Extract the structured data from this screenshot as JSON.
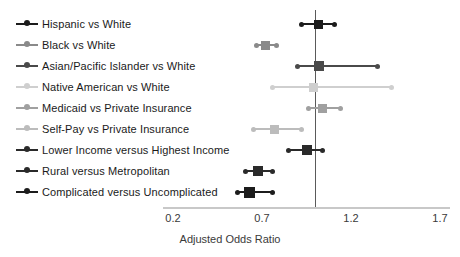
{
  "chart_data": {
    "type": "scatter",
    "subtype": "forest-plot",
    "title": "",
    "xlabel": "Adjusted Odds Ratio",
    "ylabel": "",
    "xlim": [
      0.2,
      1.7
    ],
    "xticks": [
      0.2,
      0.7,
      1.2,
      1.7
    ],
    "xtick_labels": [
      "0.2",
      "0.7",
      "1.2",
      "1.7"
    ],
    "reference_line": 1.0,
    "grid": false,
    "legend_position": "left-inline",
    "categories": [
      "Hispanic vs White",
      "Black vs White",
      "Asian/Pacific Islander vs White",
      "Native American vs White",
      "Medicaid vs Private Insurance",
      "Self-Pay vs Private Insurance",
      "Lower Income versus Highest Income",
      "Rural versus Metropolitan",
      "Complicated versus Uncomplicated"
    ],
    "rows": [
      {
        "label": "Hispanic vs White",
        "or": 1.02,
        "lower": 0.92,
        "upper": 1.11,
        "color": "#1c1c1c",
        "box": 9
      },
      {
        "label": "Black vs White",
        "or": 0.72,
        "lower": 0.67,
        "upper": 0.78,
        "color": "#8a8a8a",
        "box": 9
      },
      {
        "label": "Asian/Pacific Islander vs White",
        "or": 1.02,
        "lower": 0.9,
        "upper": 1.35,
        "color": "#4a4a4a",
        "box": 10
      },
      {
        "label": "Native American vs White",
        "or": 0.99,
        "lower": 0.76,
        "upper": 1.43,
        "color": "#cfcfcf",
        "box": 9
      },
      {
        "label": "Medicaid vs Private Insurance",
        "or": 1.04,
        "lower": 0.96,
        "upper": 1.14,
        "color": "#a0a0a0",
        "box": 9
      },
      {
        "label": "Self-Pay vs Private Insurance",
        "or": 0.77,
        "lower": 0.65,
        "upper": 0.92,
        "color": "#bcbcbc",
        "box": 9
      },
      {
        "label": "Lower Income versus Highest Income",
        "or": 0.95,
        "lower": 0.85,
        "upper": 1.04,
        "color": "#2a2a2a",
        "box": 10
      },
      {
        "label": "Rural versus Metropolitan",
        "or": 0.68,
        "lower": 0.61,
        "upper": 0.76,
        "color": "#2a2a2a",
        "box": 10
      },
      {
        "label": "Complicated versus Uncomplicated",
        "or": 0.63,
        "lower": 0.56,
        "upper": 0.76,
        "color": "#1c1c1c",
        "box": 11
      }
    ]
  },
  "colors": {
    "reference_line": "#5a5a5a",
    "axis_line": "#c8c8c8",
    "text": "#1a1a1a"
  }
}
